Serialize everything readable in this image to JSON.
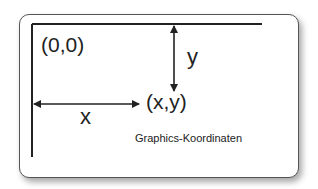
{
  "diagram": {
    "origin_label": "(0,0)",
    "y_label": "y",
    "x_label": "x",
    "point_label": "(x,y)",
    "caption": "Graphics-Koordinaten"
  }
}
